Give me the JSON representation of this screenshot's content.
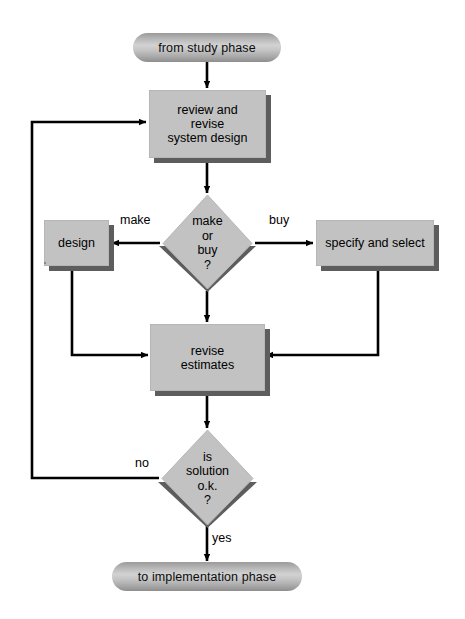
{
  "diagram": {
    "colors": {
      "node_fill": "#c2c2c2",
      "node_shadow": "#5d5d5d",
      "terminator_fill": "#b4b4b4",
      "connector": "#000000",
      "background": "#ffffff"
    },
    "nodes": [
      {
        "id": "start",
        "type": "terminator",
        "label": "from study phase"
      },
      {
        "id": "review",
        "type": "process",
        "label": "review and\nrevise\nsystem design"
      },
      {
        "id": "make-or-buy",
        "type": "decision",
        "label": "make\nor\nbuy\n?"
      },
      {
        "id": "design",
        "type": "process",
        "label": "design"
      },
      {
        "id": "specify",
        "type": "process",
        "label": "specify and select"
      },
      {
        "id": "revise-estimates",
        "type": "process",
        "label": "revise\nestimates"
      },
      {
        "id": "is-solution-ok",
        "type": "decision",
        "label": "is\nsolution\no.k.\n?"
      },
      {
        "id": "end",
        "type": "terminator",
        "label": "to implementation phase"
      }
    ],
    "edge_labels": {
      "make": "make",
      "buy": "buy",
      "no": "no",
      "yes": "yes"
    }
  }
}
